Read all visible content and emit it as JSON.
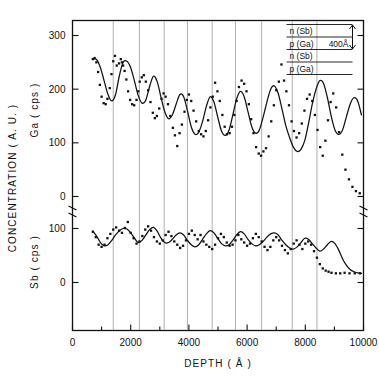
{
  "figure": {
    "title": "",
    "axis_labels": {
      "x": "DEPTH  ( Å )",
      "y_outer": "CONCENTRATION  ( A. U. )",
      "y_upper": "Ga  ( cps )",
      "y_lower": "Sb  ( cps )"
    },
    "x_ticks": [
      "0",
      "2000",
      "4000",
      "6000",
      "8000",
      "10000"
    ],
    "y_upper_ticks": [
      "0",
      "100",
      "200",
      "300"
    ],
    "y_lower_ticks": [
      "0",
      "100"
    ],
    "axis_break": "zigzag-break",
    "inset": {
      "layers": [
        "n (Sb)",
        "p (Ga)",
        "n (Sb)",
        "p (Ga)"
      ],
      "dimension_label": "400Å"
    }
  },
  "chart_data": {
    "type": "line",
    "title": "",
    "xlabel": "DEPTH  ( Å )",
    "ylabel": "CONCENTRATION  ( A. U. )",
    "xlim": [
      0,
      10000
    ],
    "grid": "vertical-gridlines-at-superlattice-interfaces",
    "gridlines_x": [
      1400,
      2300,
      3150,
      3950,
      4800,
      5600,
      6500,
      7550,
      8400
    ],
    "legend": "none",
    "panels": [
      {
        "name": "Ga",
        "ylabel": "Ga  ( cps )",
        "units": "cps",
        "ylim": [
          0,
          320
        ],
        "yticks": [
          0,
          100,
          200,
          300
        ],
        "curve": {
          "x": [
            700,
            830,
            960,
            1090,
            1220,
            1350,
            1480,
            1610,
            1740,
            1870,
            2000,
            2130,
            2260,
            2390,
            2520,
            2650,
            2780,
            2910,
            3040,
            3170,
            3300,
            3430,
            3560,
            3690,
            3820,
            3950,
            4080,
            4210,
            4340,
            4470,
            4600,
            4730,
            4860,
            4990,
            5120,
            5250,
            5380,
            5510,
            5640,
            5770,
            5900,
            6030,
            6160,
            6290,
            6420,
            6550,
            6680,
            6810,
            6940,
            7070,
            7200,
            7330,
            7460,
            7590,
            7720,
            7850,
            7980,
            8110,
            8240,
            8370,
            8500,
            8630,
            8760,
            8890,
            9020,
            9150,
            9280,
            9410,
            9540,
            9670,
            9800,
            9930
          ],
          "y": [
            257,
            255,
            240,
            215,
            190,
            178,
            190,
            225,
            250,
            252,
            240,
            215,
            188,
            174,
            180,
            205,
            224,
            214,
            185,
            158,
            145,
            152,
            172,
            190,
            186,
            160,
            130,
            116,
            120,
            140,
            168,
            186,
            176,
            148,
            122,
            114,
            124,
            152,
            182,
            196,
            186,
            158,
            130,
            118,
            124,
            148,
            176,
            200,
            206,
            192,
            163,
            132,
            110,
            92,
            84,
            88,
            104,
            136,
            172,
            200,
            216,
            210,
            184,
            150,
            124,
            116,
            124,
            148,
            172,
            184,
            178,
            152
          ]
        },
        "scatter": {
          "x": [
            700,
            760,
            820,
            880,
            940,
            1000,
            1070,
            1140,
            1200,
            1280,
            1340,
            1400,
            1460,
            1520,
            1600,
            1660,
            1700,
            1740,
            1790,
            1850,
            1910,
            1980,
            2050,
            2120,
            2200,
            2260,
            2310,
            2380,
            2450,
            2520,
            2600,
            2680,
            2760,
            2830,
            2900,
            2980,
            3060,
            3130,
            3200,
            3280,
            3360,
            3450,
            3520,
            3600,
            3680,
            3760,
            3850,
            3930,
            4000,
            4080,
            4160,
            4250,
            4340,
            4420,
            4500,
            4580,
            4660,
            4740,
            4820,
            4900,
            4980,
            5060,
            5150,
            5230,
            5310,
            5400,
            5480,
            5560,
            5640,
            5720,
            5810,
            5900,
            5980,
            6060,
            6140,
            6220,
            6310,
            6400,
            6480,
            6560,
            6650,
            6740,
            6830,
            6920,
            7000,
            7090,
            7180,
            7270,
            7350,
            7440,
            7530,
            7610,
            7700,
            7790,
            7880,
            7970,
            8060,
            8150,
            8240,
            8330,
            8420,
            8510,
            8600,
            8690,
            8780,
            8870,
            8960,
            9060,
            9160,
            9270,
            9380,
            9500,
            9620,
            9740,
            9870
          ],
          "y": [
            256,
            258,
            250,
            232,
            208,
            186,
            174,
            172,
            182,
            202,
            228,
            252,
            262,
            244,
            248,
            256,
            250,
            244,
            234,
            218,
            196,
            180,
            172,
            170,
            180,
            196,
            214,
            222,
            226,
            214,
            198,
            176,
            156,
            146,
            150,
            164,
            182,
            192,
            186,
            172,
            150,
            128,
            114,
            94,
            118,
            134,
            158,
            180,
            190,
            178,
            160,
            140,
            122,
            116,
            112,
            122,
            142,
            166,
            186,
            212,
            196,
            178,
            152,
            130,
            116,
            118,
            130,
            152,
            178,
            204,
            216,
            210,
            196,
            172,
            144,
            118,
            92,
            80,
            76,
            84,
            90,
            112,
            140,
            170,
            198,
            214,
            246,
            216,
            196,
            170,
            140,
            122,
            110,
            118,
            136,
            160,
            182,
            190,
            178,
            152,
            124,
            92,
            76,
            104,
            142,
            176,
            192,
            166,
            120,
            78,
            50,
            32,
            18,
            10,
            6
          ]
        }
      },
      {
        "name": "Sb",
        "ylabel": "Sb  ( cps )",
        "units": "cps",
        "ylim": [
          0,
          120
        ],
        "yticks": [
          0,
          100
        ],
        "curve": {
          "x": [
            700,
            830,
            960,
            1090,
            1220,
            1350,
            1480,
            1610,
            1740,
            1870,
            2000,
            2130,
            2260,
            2390,
            2520,
            2650,
            2780,
            2910,
            3040,
            3170,
            3300,
            3430,
            3560,
            3690,
            3820,
            3950,
            4080,
            4210,
            4340,
            4470,
            4600,
            4730,
            4860,
            4990,
            5120,
            5250,
            5380,
            5510,
            5640,
            5770,
            5900,
            6030,
            6160,
            6290,
            6420,
            6550,
            6680,
            6810,
            6940,
            7070,
            7200,
            7330,
            7460,
            7590,
            7720,
            7850,
            7980,
            8110,
            8240,
            8370,
            8500,
            8630,
            8760,
            8890,
            9020,
            9150,
            9280,
            9410,
            9540,
            9670,
            9800,
            9930
          ],
          "y": [
            95,
            86,
            74,
            68,
            70,
            78,
            88,
            96,
            100,
            99,
            92,
            82,
            74,
            78,
            88,
            98,
            102,
            95,
            82,
            74,
            74,
            80,
            88,
            92,
            88,
            78,
            70,
            66,
            70,
            80,
            90,
            96,
            92,
            82,
            72,
            68,
            70,
            78,
            88,
            94,
            90,
            80,
            72,
            68,
            70,
            76,
            84,
            90,
            92,
            88,
            78,
            70,
            64,
            62,
            66,
            74,
            82,
            80,
            72,
            64,
            58,
            62,
            70,
            76,
            72,
            60,
            44,
            32,
            24,
            20,
            18,
            17
          ]
        },
        "scatter": {
          "x": [
            700,
            800,
            900,
            1000,
            1100,
            1200,
            1300,
            1400,
            1500,
            1600,
            1700,
            1800,
            1900,
            2000,
            2100,
            2200,
            2300,
            2400,
            2500,
            2600,
            2700,
            2800,
            2900,
            3000,
            3100,
            3200,
            3300,
            3400,
            3500,
            3600,
            3700,
            3800,
            3900,
            4000,
            4100,
            4200,
            4300,
            4400,
            4500,
            4600,
            4700,
            4800,
            4900,
            5000,
            5100,
            5200,
            5300,
            5400,
            5500,
            5600,
            5700,
            5800,
            5900,
            6000,
            6100,
            6200,
            6300,
            6400,
            6500,
            6600,
            6700,
            6800,
            6900,
            7000,
            7100,
            7200,
            7300,
            7400,
            7500,
            7600,
            7700,
            7800,
            7900,
            8000,
            8100,
            8200,
            8300,
            8400,
            8500,
            8600,
            8700,
            8800,
            8900,
            9050,
            9200,
            9350,
            9520,
            9700,
            9880
          ],
          "y": [
            94,
            84,
            70,
            66,
            70,
            82,
            90,
            98,
            102,
            96,
            92,
            101,
            112,
            92,
            82,
            72,
            76,
            86,
            98,
            104,
            96,
            84,
            76,
            72,
            78,
            88,
            94,
            86,
            76,
            70,
            64,
            68,
            78,
            90,
            96,
            88,
            80,
            88,
            76,
            70,
            66,
            62,
            70,
            82,
            90,
            84,
            74,
            68,
            70,
            78,
            88,
            80,
            74,
            68,
            72,
            82,
            90,
            84,
            76,
            66,
            60,
            66,
            78,
            84,
            78,
            68,
            60,
            54,
            62,
            72,
            78,
            70,
            62,
            72,
            76,
            70,
            58,
            46,
            34,
            26,
            22,
            20,
            18,
            17,
            17,
            18,
            17,
            17,
            17
          ]
        }
      }
    ]
  }
}
